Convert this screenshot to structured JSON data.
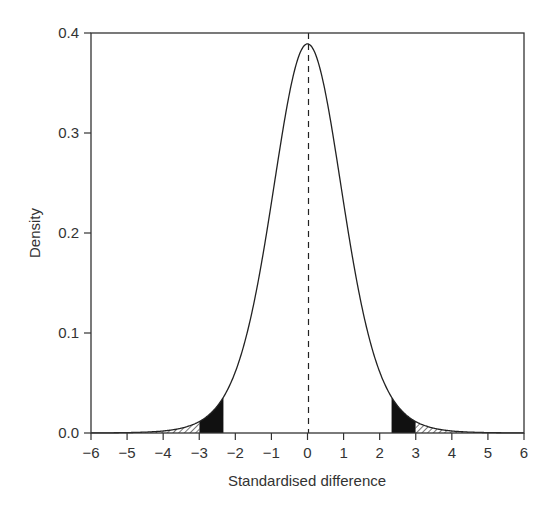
{
  "chart_data": {
    "type": "line",
    "title": "",
    "xlabel": "Standardised difference",
    "ylabel": "Density",
    "xlim": [
      -6,
      6
    ],
    "ylim": [
      0,
      0.4
    ],
    "x_ticks": [
      -6,
      -5,
      -4,
      -3,
      -2,
      -1,
      0,
      1,
      2,
      3,
      4,
      5,
      6
    ],
    "x_tick_labels": [
      "−6",
      "−5",
      "−4",
      "−3",
      "−2",
      "−1",
      "0",
      "1",
      "2",
      "3",
      "4",
      "5",
      "6"
    ],
    "y_ticks": [
      0.0,
      0.1,
      0.2,
      0.3,
      0.4
    ],
    "y_tick_labels": [
      "0.0",
      "0.1",
      "0.2",
      "0.3",
      "0.4"
    ],
    "grid": false,
    "legend": null,
    "series": [
      {
        "name": "density curve (t-like, ~10 df)",
        "df": 10,
        "x": [
          -6,
          -5,
          -4,
          -3.5,
          -3,
          -2.5,
          -2.33,
          -2,
          -1.5,
          -1,
          -0.5,
          0,
          0.5,
          1,
          1.5,
          2,
          2.33,
          2.5,
          3,
          3.5,
          4,
          4.5,
          5,
          6
        ],
        "y": [
          0.0005,
          0.0014,
          0.0051,
          0.0099,
          0.0114,
          0.0245,
          0.0327,
          0.0611,
          0.1274,
          0.2304,
          0.3397,
          0.3891,
          0.3397,
          0.2304,
          0.1274,
          0.0611,
          0.0327,
          0.0245,
          0.0114,
          0.0051,
          0.002,
          0.0009,
          0.0004,
          0.0001
        ]
      }
    ],
    "annotations": [
      {
        "type": "vline",
        "x": 0,
        "style": "dashed"
      },
      {
        "type": "shaded-region",
        "fill": "black",
        "x_range": [
          -3,
          -2.33
        ]
      },
      {
        "type": "shaded-region",
        "fill": "black",
        "x_range": [
          2.33,
          3
        ]
      },
      {
        "type": "shaded-region",
        "fill": "hatched",
        "x_range": [
          -4.5,
          -3
        ]
      },
      {
        "type": "shaded-region",
        "fill": "hatched",
        "x_range": [
          3,
          4.5
        ]
      }
    ]
  }
}
